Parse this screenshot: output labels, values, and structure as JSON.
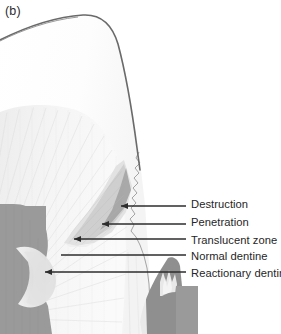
{
  "figure": {
    "panel_label": "(b)",
    "width": 281,
    "height": 334,
    "background_color": "#ffffff",
    "description_kind": "tooth-caries-cross-section"
  },
  "palette": {
    "outline": "#5e5e5e",
    "enamel": "#fbfbfb",
    "dentine": "#f2f2f2",
    "dentine_tubules": "#e6e6e6",
    "translucent_zone": "#dcdcdc",
    "penetration": "#c6c6c6",
    "destruction": "#a8a8a8",
    "pulp": "#9a9a9a",
    "reactionary_dentine": "#e4e4e4",
    "leader_line": "#2d2d2d",
    "text": "#262626"
  },
  "callouts": [
    {
      "id": "destruction",
      "label": "Destruction",
      "text_x": 191,
      "text_y": 198,
      "line_x1": 121,
      "line_y1": 206,
      "line_x2": 186,
      "line_y2": 206,
      "arrow": "left"
    },
    {
      "id": "penetration",
      "label": "Penetration",
      "text_x": 191,
      "text_y": 216,
      "line_x1": 102,
      "line_y1": 224,
      "line_x2": 186,
      "line_y2": 224,
      "arrow": "left"
    },
    {
      "id": "translucent-zone",
      "label": "Translucent zone",
      "text_x": 191,
      "text_y": 234,
      "line_x1": 75,
      "line_y1": 239,
      "line_x2": 186,
      "line_y2": 239,
      "arrow": "left"
    },
    {
      "id": "normal-dentine",
      "label": "Normal dentine",
      "text_x": 191,
      "text_y": 252,
      "line_x1": 62,
      "line_y1": 255,
      "line_x2": 186,
      "line_y2": 255,
      "arrow": "left"
    },
    {
      "id": "reactionary-dentine",
      "label": "Reactionary dentine",
      "text_x": 191,
      "text_y": 270,
      "line_x1": 46,
      "line_y1": 272,
      "line_x2": 186,
      "line_y2": 272,
      "arrow": "left"
    }
  ],
  "anatomy": [
    {
      "id": "enamel",
      "name": "Enamel"
    },
    {
      "id": "dentine",
      "name": "Dentine"
    },
    {
      "id": "pulp-chamber",
      "name": "Pulp chamber"
    },
    {
      "id": "carious-lesion",
      "name": "Carious lesion"
    }
  ]
}
